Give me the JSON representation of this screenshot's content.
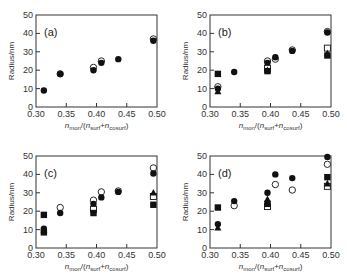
{
  "chart_data": [
    {
      "type": "scatter",
      "panel": "(a)",
      "xlabel": "n_mon/(n_surf+n_cosurf)",
      "ylabel": "Radius/nm",
      "xlim": [
        0.3,
        0.5
      ],
      "ylim": [
        0,
        50
      ],
      "xticks": [
        "0.30",
        "0.35",
        "0.40",
        "0.45",
        "0.50"
      ],
      "yticks": [
        "0",
        "10",
        "20",
        "30",
        "40",
        "50"
      ],
      "series": [
        {
          "name": "open-circle",
          "marker": "circle-open",
          "points": [
            [
              0.34,
              18
            ],
            [
              0.395,
              21.5
            ],
            [
              0.408,
              25
            ],
            [
              0.494,
              37
            ]
          ]
        },
        {
          "name": "filled-circle",
          "marker": "circle-filled",
          "points": [
            [
              0.313,
              9
            ],
            [
              0.34,
              18
            ],
            [
              0.395,
              20
            ],
            [
              0.408,
              24
            ],
            [
              0.436,
              26
            ],
            [
              0.494,
              36
            ]
          ]
        }
      ]
    },
    {
      "type": "scatter",
      "panel": "(b)",
      "xlabel": "n_mon/(n_surf+n_cosurf)",
      "ylabel": "Radius/nm",
      "xlim": [
        0.3,
        0.5
      ],
      "ylim": [
        0,
        50
      ],
      "xticks": [
        "0.30",
        "0.35",
        "0.40",
        "0.45",
        "0.50"
      ],
      "yticks": [
        "0",
        "10",
        "20",
        "30",
        "40",
        "50"
      ],
      "series": [
        {
          "name": "open-circle",
          "marker": "circle-open",
          "points": [
            [
              0.313,
              11
            ],
            [
              0.395,
              25
            ],
            [
              0.408,
              26
            ],
            [
              0.436,
              31
            ],
            [
              0.494,
              41
            ]
          ]
        },
        {
          "name": "filled-circle",
          "marker": "circle-filled",
          "points": [
            [
              0.313,
              10
            ],
            [
              0.34,
              19
            ],
            [
              0.395,
              24
            ],
            [
              0.408,
              27
            ],
            [
              0.436,
              30.5
            ],
            [
              0.494,
              40.5
            ]
          ]
        },
        {
          "name": "open-square",
          "marker": "square-open",
          "points": [
            [
              0.395,
              21
            ],
            [
              0.494,
              32
            ]
          ]
        },
        {
          "name": "filled-square",
          "marker": "square-filled",
          "points": [
            [
              0.313,
              18
            ],
            [
              0.395,
              19.5
            ],
            [
              0.494,
              28
            ]
          ]
        },
        {
          "name": "filled-triangle",
          "marker": "triangle-filled",
          "points": [
            [
              0.313,
              8.5
            ],
            [
              0.395,
              20
            ],
            [
              0.494,
              29
            ]
          ]
        }
      ]
    },
    {
      "type": "scatter",
      "panel": "(c)",
      "xlabel": "n_mon/(n_surf+n_cosurf)",
      "ylabel": "Radius/nm",
      "xlim": [
        0.3,
        0.5
      ],
      "ylim": [
        0,
        50
      ],
      "xticks": [
        "0.30",
        "0.35",
        "0.40",
        "0.45",
        "0.50"
      ],
      "yticks": [
        "0",
        "10",
        "20",
        "30",
        "40",
        "50"
      ],
      "series": [
        {
          "name": "open-circle",
          "marker": "circle-open",
          "points": [
            [
              0.34,
              22
            ],
            [
              0.395,
              26
            ],
            [
              0.408,
              30.5
            ],
            [
              0.436,
              31
            ],
            [
              0.494,
              43.5
            ]
          ]
        },
        {
          "name": "filled-circle",
          "marker": "circle-filled",
          "points": [
            [
              0.313,
              10.5
            ],
            [
              0.34,
              19
            ],
            [
              0.395,
              24
            ],
            [
              0.408,
              27.5
            ],
            [
              0.436,
              30.5
            ],
            [
              0.494,
              40.5
            ]
          ]
        },
        {
          "name": "open-square",
          "marker": "square-open",
          "points": [
            [
              0.395,
              21
            ],
            [
              0.494,
              28
            ]
          ]
        },
        {
          "name": "filled-square",
          "marker": "square-filled",
          "points": [
            [
              0.313,
              18
            ],
            [
              0.313,
              8.5
            ],
            [
              0.395,
              19
            ],
            [
              0.494,
              23.5
            ]
          ]
        },
        {
          "name": "filled-triangle",
          "marker": "triangle-filled",
          "points": [
            [
              0.313,
              10
            ],
            [
              0.494,
              30
            ]
          ]
        }
      ]
    },
    {
      "type": "scatter",
      "panel": "(d)",
      "xlabel": "n_mon/(n_surf+n_cosurf)",
      "ylabel": "Radius/nm",
      "xlim": [
        0.3,
        0.5
      ],
      "ylim": [
        0,
        50
      ],
      "xticks": [
        "0.30",
        "0.35",
        "0.40",
        "0.45",
        "0.50"
      ],
      "yticks": [
        "0",
        "10",
        "20",
        "30",
        "40",
        "50"
      ],
      "series": [
        {
          "name": "open-circle",
          "marker": "circle-open",
          "points": [
            [
              0.34,
              23
            ],
            [
              0.408,
              34.5
            ],
            [
              0.436,
              31.5
            ],
            [
              0.494,
              45.5
            ]
          ]
        },
        {
          "name": "filled-circle",
          "marker": "circle-filled",
          "points": [
            [
              0.313,
              13
            ],
            [
              0.34,
              25.5
            ],
            [
              0.395,
              30
            ],
            [
              0.408,
              40
            ],
            [
              0.436,
              38
            ],
            [
              0.494,
              49.5
            ]
          ]
        },
        {
          "name": "open-square",
          "marker": "square-open",
          "points": [
            [
              0.395,
              22.5
            ],
            [
              0.494,
              33.5
            ]
          ]
        },
        {
          "name": "filled-square",
          "marker": "square-filled",
          "points": [
            [
              0.313,
              22
            ],
            [
              0.395,
              24
            ],
            [
              0.494,
              38.5
            ]
          ]
        },
        {
          "name": "filled-triangle",
          "marker": "triangle-filled",
          "points": [
            [
              0.313,
              11
            ],
            [
              0.395,
              26.5
            ],
            [
              0.494,
              35
            ]
          ]
        }
      ]
    }
  ]
}
